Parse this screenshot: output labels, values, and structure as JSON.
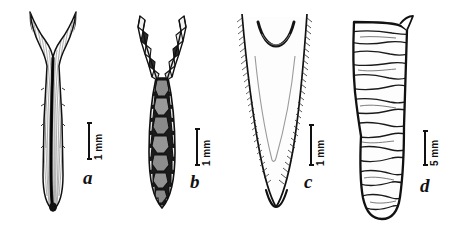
{
  "plate": {
    "title": "Comparative plate of four elongate tapering specimens",
    "background_color": "#ffffff",
    "ink_color": "#111111",
    "width": 453,
    "height": 230,
    "panel_count": 4
  },
  "panels": [
    {
      "label": "a",
      "scale_value": "1 mm",
      "description": "Ventral view of a broad V-shaped bilobed structure with two slender divergent apical horns, fine radiating striations fanning from a dark narrow median keel, and a rounded blunt distal tip.",
      "shading": "fine line hatching, pale interior, dark median line",
      "apex_form": "two slender divergent horns",
      "tip_form": "rounded blunt",
      "label_position": {
        "x": 83,
        "y": 168
      },
      "scalebar_position": {
        "x": 88,
        "y": 122,
        "height": 38
      }
    },
    {
      "label": "b",
      "scale_value": "1 mm",
      "description": "Same structure with surface armour shown: body covered in a mosaic of polygonal plates, larger dark grey plates along the midline flanked by smaller pale marginal plates; the two apical horns are segmented into blocky articulated pieces.",
      "shading": "tessellated polygonal plates, dark grey and white",
      "apex_form": "two segmented spinose horns",
      "tip_form": "rounded, plated",
      "label_position": {
        "x": 190,
        "y": 172
      },
      "scalebar_position": {
        "x": 196,
        "y": 128,
        "height": 38
      }
    },
    {
      "label": "c",
      "scale_value": "1 mm",
      "description": "Elongate narrow blade tapering to a slender rounded point, margins densely hatched with short parallel strokes; a separate crescent-shaped arc sits across the concave upper border and a faint internal V-shaped outline runs down the centre.",
      "shading": "dense marginal hatching, open interior",
      "apex_form": "concave notch with detached crescent arc",
      "tip_form": "narrow rounded point",
      "label_position": {
        "x": 304,
        "y": 172
      },
      "scalebar_position": {
        "x": 310,
        "y": 124,
        "height": 42
      }
    },
    {
      "label": "d",
      "scale_value": "5 mm",
      "description": "Stout club-shaped element with a thick dark outline, crossed by numerous irregular transverse growth bands; widest near the top, constricted at mid-length, expanding slightly to a broadly rounded base.",
      "shading": "heavy outline, irregular transverse banding",
      "apex_form": "obliquely truncate with small projection",
      "tip_form": "broadly rounded base",
      "label_position": {
        "x": 420,
        "y": 176
      },
      "scalebar_position": {
        "x": 424,
        "y": 130,
        "height": 36
      }
    }
  ]
}
